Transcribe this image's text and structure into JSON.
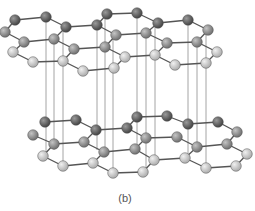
{
  "figure": {
    "caption": "(b)",
    "colors": {
      "dark": "#5a5a5a",
      "mid": "#8a8a8a",
      "light": "#c8c8c8",
      "bond": "#555555",
      "interlayer": "#9a9a9a"
    }
  },
  "layers": [
    {
      "name": "top",
      "atoms": [
        [
          15,
          20,
          "d"
        ],
        [
          46,
          17,
          "d"
        ],
        [
          66,
          27,
          "d"
        ],
        [
          97,
          25,
          "d"
        ],
        [
          107,
          14,
          "d"
        ],
        [
          137,
          13,
          "d"
        ],
        [
          158,
          23,
          "d"
        ],
        [
          188,
          20,
          "d"
        ],
        [
          208,
          30,
          "m"
        ],
        [
          5,
          32,
          "m"
        ],
        [
          24,
          42,
          "m"
        ],
        [
          54,
          39,
          "m"
        ],
        [
          74,
          49,
          "m"
        ],
        [
          105,
          47,
          "m"
        ],
        [
          116,
          35,
          "m"
        ],
        [
          146,
          33,
          "m"
        ],
        [
          167,
          43,
          "m"
        ],
        [
          197,
          42,
          "m"
        ],
        [
          217,
          52,
          "l"
        ],
        [
          13,
          52,
          "l"
        ],
        [
          33,
          62,
          "l"
        ],
        [
          63,
          61,
          "l"
        ],
        [
          83,
          71,
          "l"
        ],
        [
          114,
          68,
          "l"
        ],
        [
          125,
          57,
          "l"
        ],
        [
          155,
          55,
          "l"
        ],
        [
          175,
          65,
          "l"
        ],
        [
          206,
          63,
          "l"
        ]
      ]
    },
    {
      "name": "bottom",
      "atoms": [
        [
          45,
          122,
          "d"
        ],
        [
          76,
          120,
          "d"
        ],
        [
          96,
          130,
          "d"
        ],
        [
          127,
          128,
          "d"
        ],
        [
          137,
          117,
          "d"
        ],
        [
          167,
          116,
          "d"
        ],
        [
          188,
          124,
          "d"
        ],
        [
          218,
          122,
          "d"
        ],
        [
          237,
          132,
          "m"
        ],
        [
          33,
          135,
          "m"
        ],
        [
          54,
          144,
          "m"
        ],
        [
          84,
          142,
          "m"
        ],
        [
          104,
          152,
          "m"
        ],
        [
          135,
          149,
          "m"
        ],
        [
          146,
          138,
          "m"
        ],
        [
          177,
          137,
          "m"
        ],
        [
          197,
          147,
          "m"
        ],
        [
          227,
          144,
          "m"
        ],
        [
          247,
          154,
          "l"
        ],
        [
          43,
          156,
          "l"
        ],
        [
          63,
          166,
          "l"
        ],
        [
          93,
          163,
          "l"
        ],
        [
          113,
          173,
          "l"
        ],
        [
          143,
          172,
          "l"
        ],
        [
          154,
          160,
          "l"
        ],
        [
          185,
          158,
          "l"
        ],
        [
          206,
          168,
          "l"
        ],
        [
          236,
          166,
          "l"
        ]
      ]
    }
  ],
  "interlayer_lines_x": [
    46,
    54,
    63,
    97,
    105,
    113,
    137,
    146,
    155,
    188,
    197,
    206
  ]
}
